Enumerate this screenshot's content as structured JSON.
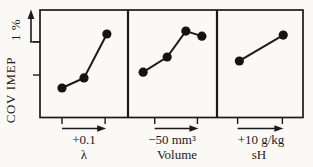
{
  "chart_data": {
    "type": "line",
    "title": "",
    "ylabel": "COV IMEP",
    "scale_bar_label": "1 %",
    "ink_color": "#1b1b1b",
    "paper_color": "#faf9f6",
    "y_axis": {
      "tick_pcts": [
        1.18,
        2.1
      ],
      "scale_bar_pct": 1
    },
    "panels": [
      {
        "id": "lambda",
        "change_label": "+0.1",
        "axis_label": "λ",
        "x_ticks": [
          0.25,
          0.74
        ],
        "points": [
          {
            "x": 0.25,
            "y": 0.82
          },
          {
            "x": 0.5,
            "y": 1.1
          },
          {
            "x": 0.76,
            "y": 2.32
          }
        ]
      },
      {
        "id": "volume",
        "change_label": "−50 mm³",
        "axis_label": "Volume",
        "x_ticks": [
          0.3,
          0.78
        ],
        "points": [
          {
            "x": 0.17,
            "y": 1.26
          },
          {
            "x": 0.44,
            "y": 1.68
          },
          {
            "x": 0.65,
            "y": 2.4
          },
          {
            "x": 0.83,
            "y": 2.26
          }
        ]
      },
      {
        "id": "sh",
        "change_label": "+10 g/kg",
        "axis_label": "sH",
        "x_ticks": [
          0.24,
          0.76
        ],
        "points": [
          {
            "x": 0.26,
            "y": 1.57
          },
          {
            "x": 0.77,
            "y": 2.29
          }
        ]
      }
    ]
  }
}
